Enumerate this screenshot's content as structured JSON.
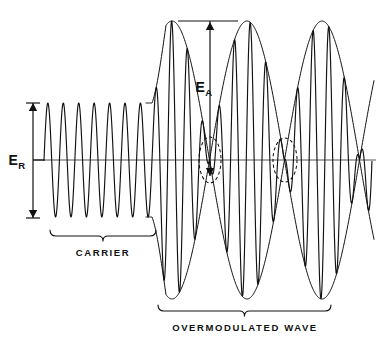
{
  "figure": {
    "background_color": "#ffffff",
    "ink_color": "#111111",
    "axis_color": "#444444",
    "width": 388,
    "height": 351
  },
  "labels": {
    "er_symbol": "E",
    "er_subscript": "R",
    "ea_symbol": "E",
    "ea_subscript": "A",
    "carrier": "CARRIER",
    "overmodulated": "OVERMODULATED  WAVE"
  },
  "chart_data": {
    "type": "line",
    "xlabel": "",
    "ylabel": "",
    "grid": false,
    "legend": "none",
    "axis": {
      "zero_line_y": 160,
      "x_start": 34,
      "x_end": 376,
      "x_min": 0,
      "x_max": 388
    },
    "annotations": [
      {
        "name": "E_R",
        "text": "E_R",
        "kind": "double-arrow-vertical",
        "x": 33,
        "y_top": 103,
        "y_bottom": 218,
        "value": 115,
        "meaning": "unmodulated carrier peak-to-peak reference amplitude",
        "label_x": 17,
        "label_y": 165
      },
      {
        "name": "E_A",
        "text": "E_A",
        "kind": "arrow-vertical-down",
        "x": 210,
        "y_top": 21,
        "y_bottom": 176,
        "value": 155,
        "meaning": "peak amplitude of overmodulated envelope",
        "label_x": 204,
        "label_y": 92,
        "tick_line": {
          "x1": 178,
          "x2": 238,
          "y": 21
        }
      },
      {
        "name": "carrier-brace",
        "text": "CARRIER",
        "kind": "brace-under",
        "x_start": 50,
        "x_end": 156,
        "y": 236,
        "label_x": 103,
        "label_y": 256
      },
      {
        "name": "overmodulated-brace",
        "text": "OVERMODULATED  WAVE",
        "kind": "brace-under",
        "x_start": 158,
        "x_end": 331,
        "y": 311,
        "label_x": 245,
        "label_y": 331
      }
    ],
    "dashed_ellipses": [
      {
        "name": "null-region-1",
        "cx": 210,
        "cy": 160,
        "rx": 11,
        "ry": 23
      },
      {
        "name": "null-region-2",
        "cx": 285,
        "cy": 160,
        "rx": 12,
        "ry": 22
      }
    ],
    "carrier_region": {
      "x_start": 44,
      "x_end": 152,
      "cycles": 7,
      "amplitude": 57,
      "description": "constant-amplitude unmodulated carrier"
    },
    "modulated_region": {
      "x_start": 152,
      "x_end": 372,
      "carrier_cycles": 14,
      "envelope_peak": 139,
      "envelope_lobes": 3,
      "envelope_peaks_x": [
        172,
        247,
        322
      ],
      "envelope_nulls_x": [
        210,
        285,
        360
      ],
      "modulation_index": 1.6,
      "description": "envelope driven negative so carrier is cut off at the nulls"
    },
    "series": [
      {
        "name": "carrier-and-overmodulated-wave",
        "color": "#111111",
        "description": "RF waveform: constant carrier then overmodulated burst"
      },
      {
        "name": "upper-envelope",
        "color": "#111111",
        "description": "positive modulation envelope of the overmodulated wave"
      },
      {
        "name": "lower-envelope",
        "color": "#111111",
        "description": "negative modulation envelope of the overmodulated wave"
      }
    ]
  }
}
